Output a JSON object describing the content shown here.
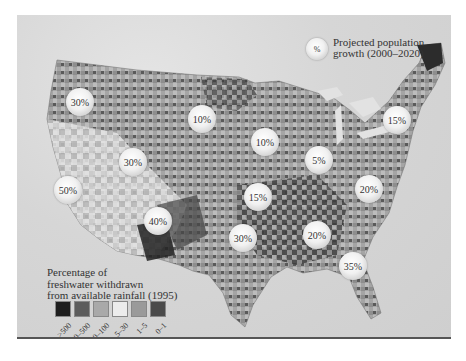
{
  "legend_growth": {
    "symbol": "%",
    "label_line1": "Projected population",
    "label_line2": "growth (2000–2020)"
  },
  "legend_withdrawal": {
    "title_line1": "Percentage of",
    "title_line2": "freshwater withdrawn",
    "title_line3": "from available rainfall (1995)",
    "classes": [
      {
        "label": ">500",
        "color": "#1e1e1e"
      },
      {
        "label": "100–500",
        "color": "#5c5c5c"
      },
      {
        "label": "30–100",
        "color": "#a9a9a9"
      },
      {
        "label": "5–30",
        "color": "#ececec"
      },
      {
        "label": "1–5",
        "color": "#9a9a9a"
      },
      {
        "label": "0–1",
        "color": "#4a4a4a"
      }
    ]
  },
  "growth_bubbles": [
    {
      "region": "Pacific Northwest",
      "value": "30%",
      "x": 80,
      "y": 102
    },
    {
      "region": "Northern Plains",
      "value": "10%",
      "x": 202,
      "y": 119
    },
    {
      "region": "Great Basin",
      "value": "30%",
      "x": 133,
      "y": 162
    },
    {
      "region": "Upper Midwest",
      "value": "10%",
      "x": 265,
      "y": 142
    },
    {
      "region": "Great Lakes",
      "value": "5%",
      "x": 319,
      "y": 160
    },
    {
      "region": "Northeast",
      "value": "15%",
      "x": 397,
      "y": 120
    },
    {
      "region": "California",
      "value": "50%",
      "x": 68,
      "y": 190
    },
    {
      "region": "Southwest",
      "value": "40%",
      "x": 158,
      "y": 221
    },
    {
      "region": "Central Plains",
      "value": "15%",
      "x": 258,
      "y": 197
    },
    {
      "region": "Mid-Atlantic",
      "value": "20%",
      "x": 369,
      "y": 189
    },
    {
      "region": "South Central",
      "value": "30%",
      "x": 243,
      "y": 238
    },
    {
      "region": "Southeast",
      "value": "20%",
      "x": 317,
      "y": 235
    },
    {
      "region": "Florida / Georgia",
      "value": "35%",
      "x": 353,
      "y": 266
    }
  ]
}
